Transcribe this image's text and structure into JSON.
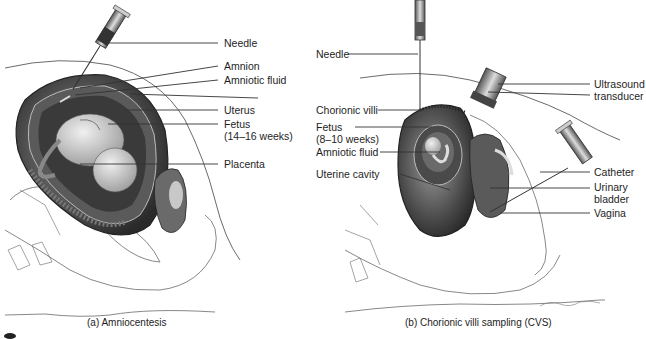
{
  "figure": {
    "panels": [
      {
        "id": "a",
        "caption": "(a) Amniocentesis",
        "labels": [
          {
            "text": "Needle"
          },
          {
            "text": "Amnion"
          },
          {
            "text": "Amniotic fluid"
          },
          {
            "text": "Uterus"
          },
          {
            "text": "Fetus"
          },
          {
            "text": "(14–16 weeks)"
          },
          {
            "text": "Placenta"
          }
        ]
      },
      {
        "id": "b",
        "caption": "(b) Chorionic villi sampling (CVS)",
        "labels": [
          {
            "text": "Needle"
          },
          {
            "text": "Ultrasound"
          },
          {
            "text": "transducer"
          },
          {
            "text": "Chorionic villi"
          },
          {
            "text": "Fetus"
          },
          {
            "text": "(8–10 weeks)"
          },
          {
            "text": "Amniotic fluid"
          },
          {
            "text": "Uterine cavity"
          },
          {
            "text": "Catheter"
          },
          {
            "text": "Urinary"
          },
          {
            "text": "bladder"
          },
          {
            "text": "Vagina"
          }
        ],
        "signature": "K.Sommerville"
      }
    ],
    "colors": {
      "line": "#2a2a2a",
      "tissue_dark": "#3c3c3c",
      "tissue_mid": "#8a8a8a",
      "tissue_light": "#d6d6d6",
      "background": "#ffffff"
    }
  }
}
